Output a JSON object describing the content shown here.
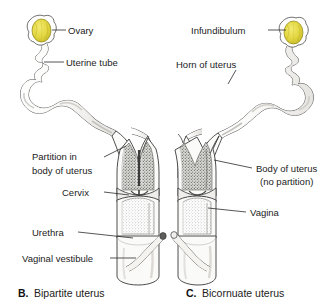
{
  "figure": {
    "background_color": "#ffffff",
    "line_color": "#3a3a3a",
    "text_color": "#1c1c1c",
    "ovary_color": "#e8dc4a",
    "ovary_shade_color": "#c9bd2e",
    "lumen_shade_color": "#8c8c8c",
    "tissue_fill": "#fbfbfa"
  },
  "panels": [
    {
      "id": "panel-b",
      "caption_letter": "B.",
      "caption_text": "Bipartite uterus",
      "labels": [
        {
          "name": "ovary",
          "text": "Ovary"
        },
        {
          "name": "uterine-tube",
          "text": "Uterine tube"
        },
        {
          "name": "partition-line1",
          "text": "Partition in"
        },
        {
          "name": "partition-line2",
          "text": "body of uterus"
        },
        {
          "name": "cervix",
          "text": "Cervix"
        },
        {
          "name": "urethra",
          "text": "Urethra"
        },
        {
          "name": "vaginal-vestibule",
          "text": "Vaginal vestibule"
        }
      ]
    },
    {
      "id": "panel-c",
      "caption_letter": "C.",
      "caption_text": "Bicornuate uterus",
      "labels": [
        {
          "name": "infundibulum",
          "text": "Infundibulum"
        },
        {
          "name": "horn-of-uterus",
          "text": "Horn of uterus"
        },
        {
          "name": "body-line1",
          "text": "Body of uterus"
        },
        {
          "name": "body-line2",
          "text": "(no partition)"
        },
        {
          "name": "vagina",
          "text": "Vagina"
        }
      ]
    }
  ]
}
